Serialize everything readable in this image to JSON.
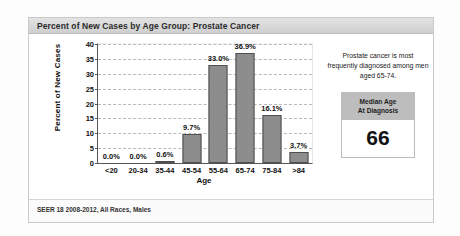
{
  "card": {
    "title": "Percent of New Cases by Age Group: Prostate Cancer",
    "footer": "SEER 18 2008-2012, All Races, Males"
  },
  "side_panel": {
    "note": "Prostate cancer is most frequently diagnosed among men aged 65-74.",
    "median_box": {
      "header_line1": "Median Age",
      "header_line2": "At Diagnosis",
      "value": "66"
    }
  },
  "colors": {
    "bar_fill": "#8d8d8d",
    "bar_stroke": "#4f4f4f",
    "title_bar": "#d8d8d8",
    "grid": "#b9b9b9",
    "median_header": "#bdbdbd"
  },
  "chart_data": {
    "type": "bar",
    "title": "Percent of New Cases by Age Group: Prostate Cancer",
    "xlabel": "Age",
    "ylabel": "Percent of New Cases",
    "categories": [
      "<20",
      "20-34",
      "35-44",
      "45-54",
      "55-64",
      "65-74",
      "75-84",
      ">84"
    ],
    "values": [
      0.0,
      0.0,
      0.6,
      9.7,
      33.0,
      36.9,
      16.1,
      3.7
    ],
    "data_labels": [
      "0.0%",
      "0.0%",
      "0.6%",
      "9.7%",
      "33.0%",
      "36.9%",
      "16.1%",
      "3.7%"
    ],
    "ylim": [
      0,
      40
    ],
    "yticks": [
      0,
      5,
      10,
      15,
      20,
      25,
      30,
      35,
      40
    ],
    "ytick_labels": [
      "0",
      "5",
      "10",
      "15",
      "20",
      "25",
      "30",
      "35",
      "40"
    ],
    "grid": true,
    "grid_style": "dashed-horizontal",
    "legend": null,
    "source": "SEER 18 2008-2012, All Races, Males"
  }
}
